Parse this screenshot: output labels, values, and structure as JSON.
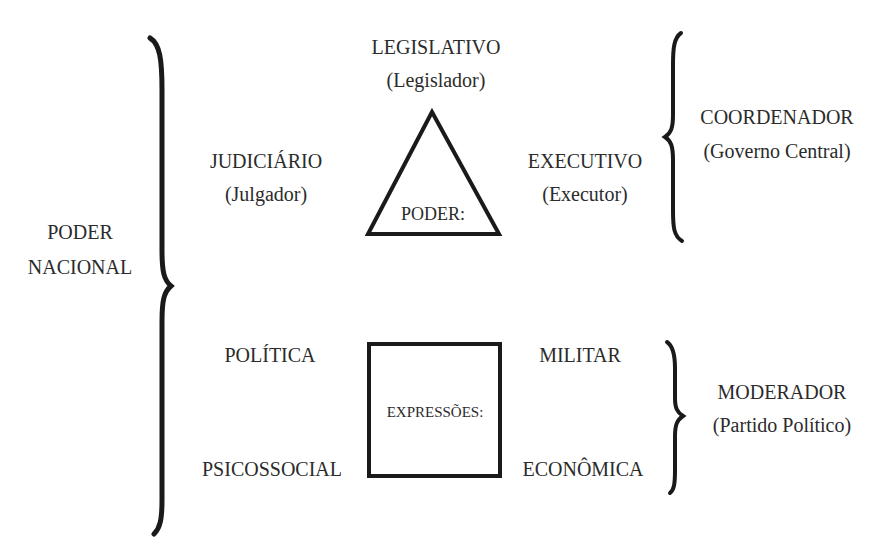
{
  "diagram": {
    "root": {
      "label_line1": "PODER",
      "label_line2": "NACIONAL"
    },
    "poder_group": {
      "shape": "triangle",
      "center_label": "PODER:",
      "vertices": [
        {
          "title": "LEGISLATIVO",
          "subtitle": "(Legislador)"
        },
        {
          "title": "JUDICIÁRIO",
          "subtitle": "(Julgador)"
        },
        {
          "title": "EXECUTIVO",
          "subtitle": "(Executor)"
        }
      ],
      "bracket_label": {
        "title": "COORDENADOR",
        "subtitle": "(Governo Central)"
      }
    },
    "expressoes_group": {
      "shape": "square",
      "center_label": "EXPRESSÕES:",
      "corners": [
        {
          "title": "POLÍTICA"
        },
        {
          "title": "MILITAR"
        },
        {
          "title": "PSICOSSOCIAL"
        },
        {
          "title": "ECONÔMICA"
        }
      ],
      "bracket_label": {
        "title": "MODERADOR",
        "subtitle": "(Partido Político)"
      }
    },
    "colors": {
      "stroke": "#1a1a1a",
      "text": "#2b2b2b",
      "background": "#ffffff"
    }
  }
}
